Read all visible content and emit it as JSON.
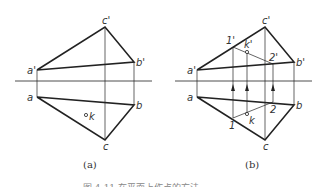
{
  "figure_a": {
    "caption": "(a)",
    "labels": {
      "a_prime": "a'",
      "b_prime": "b'",
      "c_prime": "c'",
      "a": "a",
      "b": "b",
      "c": "c",
      "k": "k"
    }
  },
  "figure_b": {
    "caption": "(b)",
    "labels": {
      "a_prime": "a'",
      "b_prime": "b'",
      "c_prime": "c'",
      "a": "a",
      "b": "b",
      "c": "c",
      "one_prime": "1'",
      "k_prime": "k'",
      "two_prime": "2'",
      "one": "1",
      "k": "k",
      "two": "2"
    }
  },
  "caption": "图 4-11  在平面上作点的方法"
}
